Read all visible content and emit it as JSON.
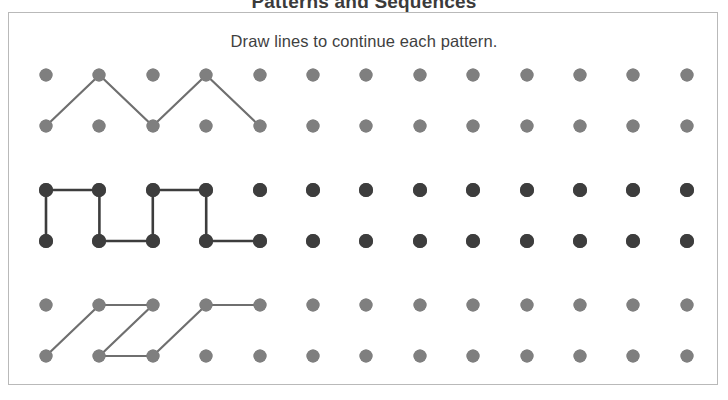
{
  "page": {
    "title": "Patterns and Sequences",
    "instruction": "Draw lines to continue each pattern."
  },
  "colors": {
    "dot_light": "#7f7f7f",
    "dot_dark": "#3d3d3d",
    "line_light": "#6f6f6f",
    "line_dark": "#3d3d3d",
    "card_border": "#b9b9b9",
    "background": "#ffffff",
    "text": "#3f3f3f"
  },
  "grid": {
    "columns": 13,
    "col_start_x": 37,
    "col_spacing": 53.4,
    "dot_radius_light": 6.5,
    "dot_radius_dark": 7.0,
    "rows": [
      {
        "name": "row-1",
        "y": 62,
        "style": "light"
      },
      {
        "name": "row-2",
        "y": 113,
        "style": "light"
      },
      {
        "name": "row-3",
        "y": 177,
        "style": "dark"
      },
      {
        "name": "row-4",
        "y": 228,
        "style": "dark"
      },
      {
        "name": "row-5",
        "y": 292,
        "style": "light"
      },
      {
        "name": "row-6",
        "y": 343,
        "style": "light"
      }
    ]
  },
  "patterns": [
    {
      "name": "pattern-zigzag",
      "label": "Zigzag pattern",
      "style": "light",
      "segments": [
        [
          0,
          1,
          1,
          0
        ],
        [
          1,
          0,
          2,
          1
        ],
        [
          2,
          1,
          3,
          0
        ],
        [
          3,
          0,
          4,
          1
        ]
      ]
    },
    {
      "name": "pattern-square-wave",
      "label": "Square wave pattern",
      "style": "dark",
      "segments": [
        [
          0,
          2,
          1,
          2
        ],
        [
          0,
          2,
          0,
          3
        ],
        [
          1,
          2,
          1,
          3
        ],
        [
          1,
          3,
          2,
          3
        ],
        [
          2,
          2,
          3,
          2
        ],
        [
          2,
          2,
          2,
          3
        ],
        [
          3,
          2,
          3,
          3
        ],
        [
          3,
          3,
          4,
          3
        ]
      ]
    },
    {
      "name": "pattern-z-slant",
      "label": "Slanted Z pattern",
      "style": "light",
      "segments": [
        [
          0,
          5,
          1,
          4
        ],
        [
          1,
          4,
          2,
          4
        ],
        [
          2,
          4,
          1,
          5
        ],
        [
          1,
          5,
          2,
          5
        ],
        [
          2,
          5,
          3,
          4
        ],
        [
          3,
          4,
          4,
          4
        ]
      ]
    }
  ]
}
